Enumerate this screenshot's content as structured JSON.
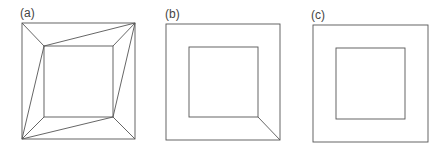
{
  "panels": [
    {
      "label": "(a)",
      "outer": [
        22,
        23,
        135,
        139
      ],
      "inner": [
        44,
        46,
        113,
        117
      ],
      "connectors": [
        [
          22,
          23,
          44,
          46
        ],
        [
          44,
          46,
          135,
          23
        ],
        [
          135,
          23,
          113,
          46
        ],
        [
          135,
          23,
          113,
          117
        ],
        [
          135,
          139,
          113,
          117
        ],
        [
          113,
          117,
          22,
          139
        ],
        [
          22,
          139,
          44,
          117
        ],
        [
          22,
          139,
          44,
          46
        ]
      ]
    },
    {
      "label": "(b)",
      "outer": [
        166,
        24,
        280,
        140
      ],
      "inner": [
        189,
        47,
        258,
        117
      ],
      "connectors": [
        [
          258,
          117,
          280,
          140
        ]
      ]
    },
    {
      "label": "(c)",
      "outer": [
        313,
        25,
        428,
        142
      ],
      "inner": [
        336,
        48,
        405,
        119
      ],
      "connectors": []
    }
  ]
}
